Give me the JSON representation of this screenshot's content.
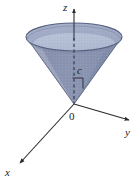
{
  "figure": {
    "background_color": "#ffffff",
    "width": 140,
    "height": 185
  },
  "axes": [
    {
      "id": "z",
      "label": "z",
      "direction": "up",
      "label_x": 63,
      "label_y": 11,
      "arrow": "arrowhead-up"
    },
    {
      "id": "y",
      "label": "y",
      "direction": "right-down",
      "label_x": 125,
      "label_y": 136,
      "arrow": "arrowhead-right"
    },
    {
      "id": "x",
      "label": "x",
      "direction": "left-down",
      "label_x": 5,
      "label_y": 176,
      "arrow": "arrowhead-left-down"
    }
  ],
  "origin": {
    "label": "0",
    "label_x": 69,
    "label_y": 120,
    "point_x": 74,
    "point_y": 104
  },
  "annotations": [
    {
      "id": "height",
      "label": "c",
      "label_x": 77,
      "label_y": 74,
      "description": "height marker c along the z-axis inside the cone"
    }
  ],
  "solid": {
    "name": "cone",
    "orientation": "apex-down",
    "apex_x": 74,
    "apex_y": 104,
    "rim_center_x": 74,
    "rim_center_y": 37,
    "rim_radius_x": 48,
    "rim_radius_y": 14,
    "body_color": "#8c96b2",
    "body_color_light": "#a7b0c6",
    "interior_color": "#b9c3d8",
    "rim_stroke": "#5a6480",
    "edge_stroke": "#6d7894"
  },
  "colors": {
    "axis": "#2b2b2b",
    "dashed": "#3a3a3a",
    "text": "#1a1a1a",
    "cone_fill": "#8c96b2",
    "cone_interior": "#b9c3d8",
    "cone_outline": "#5a6480"
  }
}
